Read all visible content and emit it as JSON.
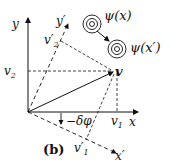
{
  "diagram": {
    "panel_label": "(b)",
    "axes": {
      "x": "x",
      "y": "y",
      "x_prime": "x′",
      "y_prime": "y′"
    },
    "vector": {
      "label": "v",
      "components": {
        "v1": "v",
        "v1_sub": "1",
        "v2": "v",
        "v2_sub": "2",
        "v1_prime": "v′",
        "v1_prime_sub": "1",
        "v2_prime": "v′",
        "v2_prime_sub": "2"
      }
    },
    "rotation_angle": "−δφ",
    "wavefunctions": {
      "psi_x": "ψ(x)",
      "psi_x_prime": "ψ(x′)"
    }
  }
}
